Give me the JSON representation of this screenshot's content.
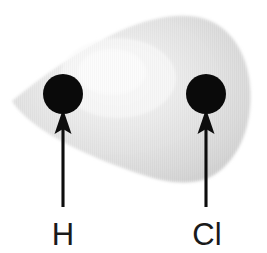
{
  "figure": {
    "type": "molecular-diagram",
    "background_color": "#ffffff",
    "canvas": {
      "width": 267,
      "height": 253
    }
  },
  "electron_cloud": {
    "name": "electron-cloud",
    "description": "Teardrop / egg shaped shaded electron cloud, pointed at left, broad and rounded at right",
    "fill_light": "#f2f2f2",
    "fill_mid": "#dcdcdc",
    "fill_dark": "#cfcfcf",
    "highlight_center_x": 118,
    "highlight_center_y": 80,
    "bounds": {
      "left": 12,
      "top": 14,
      "right": 251,
      "bottom": 182
    }
  },
  "atoms": [
    {
      "id": "hydrogen",
      "label": "H",
      "dot_name": "atom-dot-hydrogen",
      "label_name": "atom-label-hydrogen",
      "color": "#0a0a0a",
      "cx": 63,
      "cy": 94,
      "r": 20,
      "label_x": 63,
      "label_y": 245
    },
    {
      "id": "chlorine",
      "label": "Cl",
      "dot_name": "atom-dot-chlorine",
      "label_name": "atom-label-chlorine",
      "color": "#0a0a0a",
      "cx": 206,
      "cy": 94,
      "r": 20,
      "label_x": 207,
      "label_y": 245
    }
  ],
  "arrows": [
    {
      "id": "arrow-to-hydrogen",
      "points_to": "H",
      "color": "#0d0d0d",
      "x": 63,
      "tip_y": 110,
      "tail_y": 207,
      "head_width": 15,
      "head_height": 24
    },
    {
      "id": "arrow-to-chlorine",
      "points_to": "Cl",
      "color": "#0d0d0d",
      "x": 206,
      "tip_y": 110,
      "tail_y": 207,
      "head_width": 15,
      "head_height": 24
    }
  ]
}
